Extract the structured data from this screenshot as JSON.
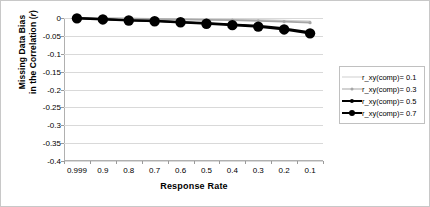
{
  "chart_data": {
    "type": "line",
    "title": "",
    "xlabel": "Response Rate",
    "ylabel_line1": "Missing Data Bias",
    "ylabel_line2_prefix": "in the Correlation (",
    "ylabel_line2_italic": "r",
    "ylabel_line2_suffix": ")",
    "categories": [
      "0.999",
      "0.9",
      "0.8",
      "0.7",
      "0.6",
      "0.5",
      "0.4",
      "0.3",
      "0.2",
      "0.1"
    ],
    "x_tick_labels": [
      "0.999",
      "0.9",
      "0.8",
      "0.7",
      "0.6",
      "0.5",
      "0.4",
      "0.3",
      "0.2",
      "0.1"
    ],
    "y_tick_labels": [
      "0",
      "-0.05",
      "-0.1",
      "-0.15",
      "-0.2",
      "-0.25",
      "-0.3",
      "-0.35",
      "-0.4"
    ],
    "y_tick_values": [
      0,
      -0.05,
      -0.1,
      -0.15,
      -0.2,
      -0.25,
      -0.3,
      -0.35,
      -0.4
    ],
    "ylim": [
      -0.4,
      0
    ],
    "grid": true,
    "legend_position": "right",
    "series": [
      {
        "name": "r_xy(comp)= 0.1",
        "color": "#d0d0d0",
        "marker": "none",
        "marker_size": 0,
        "line_width": 1.6,
        "values": [
          0.0,
          -0.001,
          -0.001,
          -0.002,
          -0.002,
          -0.003,
          -0.004,
          -0.005,
          -0.007,
          -0.009
        ]
      },
      {
        "name": "r_xy(comp)= 0.3",
        "color": "#a6a6a6",
        "marker": "circle",
        "marker_size": 1.6,
        "line_width": 1.8,
        "values": [
          0.0,
          -0.001,
          -0.002,
          -0.003,
          -0.004,
          -0.005,
          -0.006,
          -0.008,
          -0.01,
          -0.013
        ]
      },
      {
        "name": "r_xy(comp)= 0.5",
        "color": "#000000",
        "marker": "circle",
        "marker_size": 2.2,
        "line_width": 2.0,
        "values": [
          0.0,
          -0.003,
          -0.006,
          -0.008,
          -0.011,
          -0.014,
          -0.018,
          -0.022,
          -0.029,
          -0.04
        ]
      },
      {
        "name": "r_xy(comp)= 0.7",
        "color": "#000000",
        "marker": "circle",
        "marker_size": 5.2,
        "line_width": 2.2,
        "values": [
          -0.001,
          -0.004,
          -0.007,
          -0.009,
          -0.012,
          -0.016,
          -0.02,
          -0.024,
          -0.032,
          -0.043
        ]
      }
    ]
  },
  "legend": {
    "entries": [
      {
        "label": "r_xy(comp)= 0.1"
      },
      {
        "label": "r_xy(comp)= 0.3"
      },
      {
        "label": "r_xy(comp)= 0.5"
      },
      {
        "label": "r_xy(comp)= 0.7"
      }
    ]
  },
  "colors": {
    "grid": "#d9d9d9",
    "axis": "#b0b0b0",
    "frame": "#c8c8c8",
    "text": "#000000"
  }
}
